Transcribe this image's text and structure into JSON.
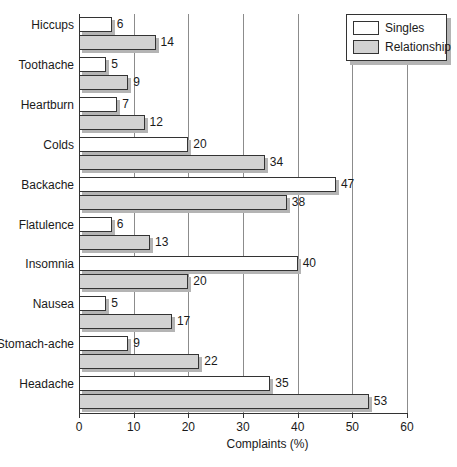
{
  "chart_data": {
    "type": "bar",
    "orientation": "horizontal",
    "title": "",
    "xlabel": "Complaints (%)",
    "ylabel": "",
    "xlim": [
      0,
      60
    ],
    "xticks": [
      0,
      10,
      20,
      30,
      40,
      50,
      60
    ],
    "grid": true,
    "legend_position": "top-right",
    "categories": [
      "Hiccups",
      "Toothache",
      "Heartburn",
      "Colds",
      "Backache",
      "Flatulence",
      "Insomnia",
      "Nausea",
      "Stomach-ache",
      "Headache"
    ],
    "series": [
      {
        "name": "Singles",
        "color": "#ffffff",
        "values": [
          6,
          5,
          7,
          20,
          47,
          6,
          40,
          5,
          9,
          35
        ]
      },
      {
        "name": "Relationship",
        "color": "#d2d2d2",
        "values": [
          14,
          9,
          12,
          34,
          38,
          13,
          20,
          17,
          22,
          53
        ]
      }
    ]
  },
  "legend": {
    "entries": [
      {
        "label": "Singles",
        "swatch": "singles"
      },
      {
        "label": "Relationship",
        "swatch": "relationship"
      }
    ]
  },
  "colors": {
    "singles_fill": "#ffffff",
    "relationship_fill": "#d2d2d2",
    "bar_outline": "#333333",
    "shadow": "#b4b4b4",
    "gridline": "#8c8c8c",
    "axis": "#333333",
    "text": "#1a1a1a",
    "background": "#ffffff"
  }
}
